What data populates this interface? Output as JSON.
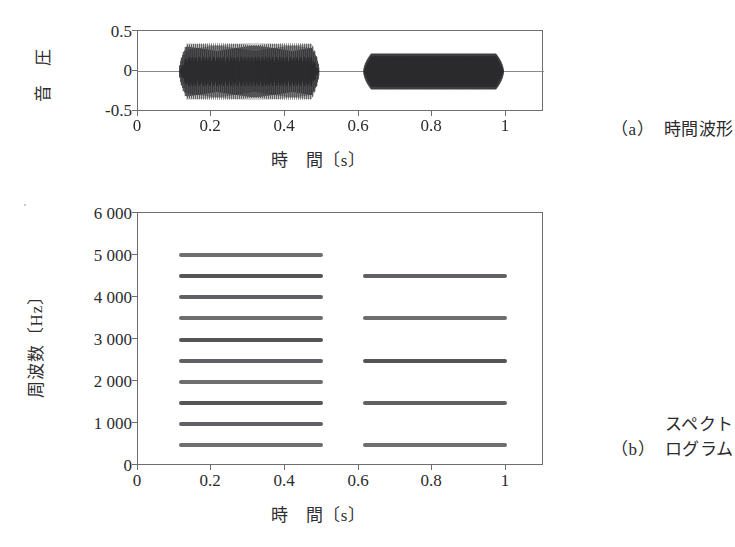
{
  "figure": {
    "panels": [
      {
        "id": "a",
        "caption_tag": "（a）",
        "caption_lines": [
          "時間波形"
        ],
        "axis": {
          "x_title": "時　間〔s〕",
          "y_title": "音　圧",
          "x_ticks": [
            "0",
            "0.2",
            "0.4",
            "0.6",
            "0.8",
            "1"
          ],
          "y_ticks": [
            "0.5",
            "0",
            "-0.5"
          ]
        }
      },
      {
        "id": "b",
        "caption_tag": "（b）",
        "caption_lines": [
          "スペクト",
          "ログラム"
        ],
        "axis": {
          "x_title": "時　間〔s〕",
          "y_title": "周波数〔Hz〕",
          "x_ticks": [
            "0",
            "0.2",
            "0.4",
            "0.6",
            "0.8",
            "1"
          ],
          "y_ticks": [
            "6 000",
            "5 000",
            "4 000",
            "3 000",
            "2 000",
            "1 000",
            "0"
          ]
        }
      }
    ]
  },
  "colors": {
    "trace": "#2b2b2d",
    "harmonic": "#4a4a4e",
    "frame": "#6e6e72",
    "zero_line": "#8a8a8e",
    "background": "#ffffff"
  },
  "chart_data": [
    {
      "type": "line",
      "title": "時間波形",
      "xlabel": "時　間〔s〕",
      "ylabel": "音　圧",
      "xlim": [
        0,
        1.1
      ],
      "ylim": [
        -0.5,
        0.5
      ],
      "xticks": [
        0,
        0.2,
        0.4,
        0.6,
        0.8,
        1
      ],
      "yticks": [
        -0.5,
        0,
        0.5
      ],
      "grid": false,
      "legend": "none",
      "series": [
        {
          "name": "burst-1",
          "t_start": 0.11,
          "t_end": 0.49,
          "peak_amplitude": 0.35,
          "waveform": "periodic-striated",
          "description": "高調波成分の多い周期波形（縦縞状）"
        },
        {
          "name": "burst-2",
          "t_start": 0.61,
          "t_end": 0.99,
          "peak_amplitude": 0.22,
          "waveform": "solid-dense",
          "description": "振幅の小さい密な周期波形"
        }
      ]
    },
    {
      "type": "heatmap",
      "title": "スペクトログラム",
      "xlabel": "時　間〔s〕",
      "ylabel": "周波数〔Hz〕",
      "xlim": [
        0,
        1.1
      ],
      "ylim": [
        0,
        6000
      ],
      "xticks": [
        0,
        0.2,
        0.4,
        0.6,
        0.8,
        1
      ],
      "yticks": [
        0,
        1000,
        2000,
        3000,
        4000,
        5000,
        6000
      ],
      "grid": false,
      "legend": "none",
      "series": [
        {
          "name": "segment-1",
          "t_start": 0.11,
          "t_end": 0.5,
          "fundamental_hz": 500,
          "harmonics_hz": [
            500,
            1000,
            1500,
            2000,
            2500,
            3000,
            3500,
            4000,
            4500,
            5000
          ]
        },
        {
          "name": "segment-2",
          "t_start": 0.61,
          "t_end": 1.0,
          "fundamental_hz": 500,
          "harmonics_hz": [
            500,
            1500,
            2500,
            3500,
            4500
          ]
        }
      ]
    }
  ]
}
